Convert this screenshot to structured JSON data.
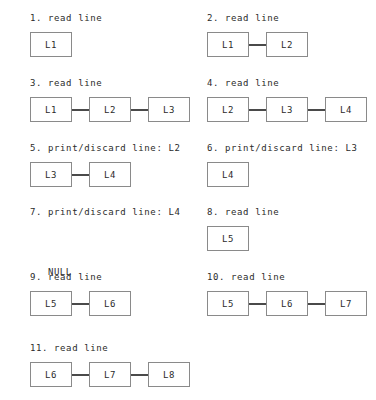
{
  "diagram": {
    "colors": {
      "background": "#ffffff",
      "node_border": "#8a8a8a",
      "link": "#4a4a4a",
      "text": "#2b2b2b"
    },
    "steps": [
      {
        "label": "1. read line",
        "nodes": [
          "L1"
        ],
        "null_text": ""
      },
      {
        "label": "2. read line",
        "nodes": [
          "L1",
          "L2"
        ],
        "null_text": ""
      },
      {
        "label": "3. read line",
        "nodes": [
          "L1",
          "L2",
          "L3"
        ],
        "null_text": ""
      },
      {
        "label": "4. read line",
        "nodes": [
          "L2",
          "L3",
          "L4"
        ],
        "null_text": ""
      },
      {
        "label": "5. print/discard line: L2",
        "nodes": [
          "L3",
          "L4"
        ],
        "null_text": ""
      },
      {
        "label": "6. print/discard line: L3",
        "nodes": [
          "L4"
        ],
        "null_text": ""
      },
      {
        "label": "7. print/discard line: L4",
        "nodes": [],
        "null_text": "NULL"
      },
      {
        "label": "8. read line",
        "nodes": [
          "L5"
        ],
        "null_text": ""
      },
      {
        "label": "9. read line",
        "nodes": [
          "L5",
          "L6"
        ],
        "null_text": ""
      },
      {
        "label": "10. read line",
        "nodes": [
          "L5",
          "L6",
          "L7"
        ],
        "null_text": ""
      },
      {
        "label": "11. read line",
        "nodes": [
          "L6",
          "L7",
          "L8"
        ],
        "null_text": ""
      }
    ]
  }
}
